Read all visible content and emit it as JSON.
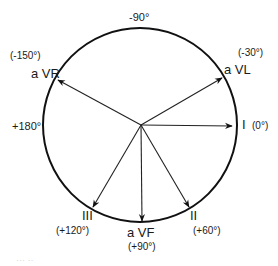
{
  "diagram": {
    "circle": {
      "cx": 140,
      "cy": 125,
      "r": 97,
      "stroke": "#111111"
    },
    "origin": {
      "x": 141,
      "y": 125
    },
    "axis_labels": {
      "top": "-90°",
      "left": "+180°"
    },
    "leads": [
      {
        "name": "aVR",
        "label": "a VR",
        "angle": "(-150°)",
        "tip": [
          58,
          80
        ]
      },
      {
        "name": "aVL",
        "label": "a VL",
        "angle": "(-30°)",
        "tip": [
          222,
          78
        ]
      },
      {
        "name": "I",
        "label": "I",
        "angle": "(0°)",
        "tip": [
          232,
          126
        ]
      },
      {
        "name": "II",
        "label": "II",
        "angle": "(+60°)",
        "tip": [
          189,
          207
        ]
      },
      {
        "name": "aVF",
        "label": "a VF",
        "angle": "(+90°)",
        "tip": [
          142,
          221
        ]
      },
      {
        "name": "III",
        "label": "III",
        "angle": "(+120°)",
        "tip": [
          93,
          207
        ]
      }
    ],
    "footer_faint": "··· ··"
  }
}
